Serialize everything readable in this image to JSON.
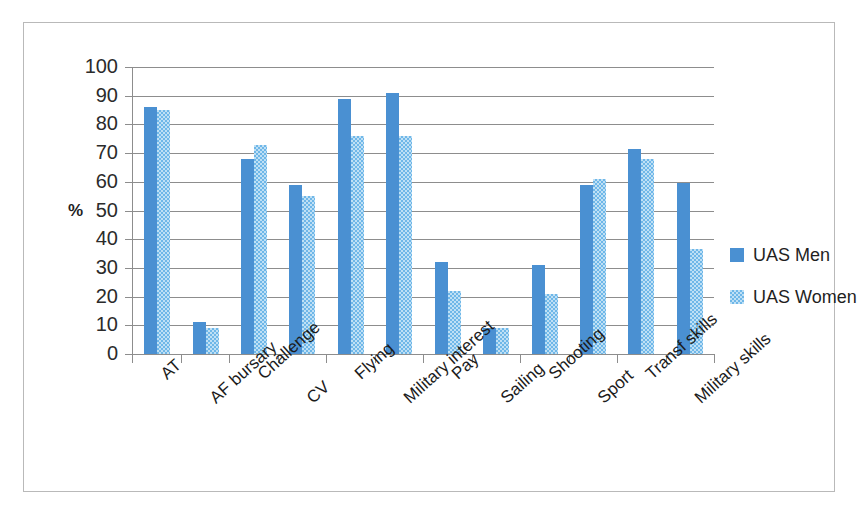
{
  "chart_data": {
    "type": "bar",
    "title": "",
    "subtitle": "",
    "xlabel": "",
    "ylabel": "%",
    "ylim": [
      0,
      100
    ],
    "ytick_step": 10,
    "ytick_labels": [
      "100",
      "90",
      "80",
      "70",
      "60",
      "50",
      "40",
      "30",
      "20",
      "10",
      "0"
    ],
    "grid": true,
    "legend_position": "right",
    "categories": [
      "AT",
      "AF bursary",
      "Challenge",
      "CV",
      "Flying",
      "Military interest",
      "Pay",
      "Sailing",
      "Shooting",
      "Sport",
      "Transf skills",
      "Military skills"
    ],
    "series": [
      {
        "name": "UAS Men",
        "color": "#4a90d2",
        "values": [
          86,
          11,
          68,
          59,
          89,
          91,
          32,
          9,
          31,
          59,
          71.5,
          59.5
        ]
      },
      {
        "name": "UAS Women",
        "color": "#a8d6f0",
        "values": [
          85,
          9,
          73,
          55,
          76,
          76,
          22,
          9,
          21,
          61,
          68,
          36.5
        ]
      }
    ]
  }
}
